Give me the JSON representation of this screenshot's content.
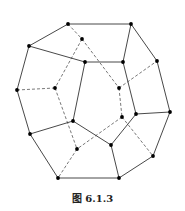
{
  "figure": {
    "caption": "图 6.1.3",
    "vertices": {
      "A": [
        68,
        24
      ],
      "B": [
        131,
        24
      ],
      "C": [
        29,
        46
      ],
      "D": [
        82,
        39
      ],
      "E": [
        85,
        62
      ],
      "F": [
        123,
        62
      ],
      "G": [
        157,
        61
      ],
      "H": [
        17,
        90
      ],
      "I": [
        55,
        88
      ],
      "J": [
        119,
        88
      ],
      "K": [
        122,
        117
      ],
      "L": [
        136,
        114
      ],
      "M": [
        170,
        112
      ],
      "N": [
        73,
        121
      ],
      "O": [
        30,
        134
      ],
      "P": [
        111,
        145
      ],
      "Q": [
        77,
        149
      ],
      "R": [
        153,
        156
      ],
      "S": [
        58,
        178
      ],
      "T": [
        119,
        178
      ]
    },
    "solid_edges": [
      [
        "A",
        "B"
      ],
      [
        "A",
        "C"
      ],
      [
        "B",
        "F"
      ],
      [
        "B",
        "G"
      ],
      [
        "C",
        "E"
      ],
      [
        "E",
        "F"
      ],
      [
        "C",
        "H"
      ],
      [
        "H",
        "O"
      ],
      [
        "E",
        "N"
      ],
      [
        "O",
        "N"
      ],
      [
        "N",
        "P"
      ],
      [
        "F",
        "L"
      ],
      [
        "P",
        "L"
      ],
      [
        "G",
        "M"
      ],
      [
        "L",
        "M"
      ],
      [
        "M",
        "R"
      ],
      [
        "O",
        "S"
      ],
      [
        "S",
        "T"
      ],
      [
        "P",
        "T"
      ],
      [
        "R",
        "T"
      ]
    ],
    "dashed_edges": [
      [
        "A",
        "D"
      ],
      [
        "D",
        "I"
      ],
      [
        "D",
        "J"
      ],
      [
        "H",
        "I"
      ],
      [
        "I",
        "Q"
      ],
      [
        "J",
        "G"
      ],
      [
        "J",
        "K"
      ],
      [
        "K",
        "Q"
      ],
      [
        "K",
        "R"
      ],
      [
        "Q",
        "S"
      ]
    ]
  }
}
